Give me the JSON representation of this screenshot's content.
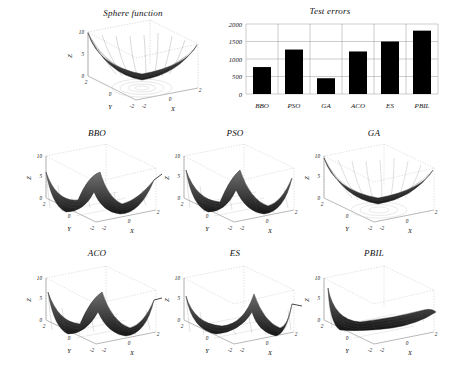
{
  "figure": {
    "panels": [
      {
        "id": "sphere",
        "title": "Sphere function",
        "kind": "surface-3d",
        "shape": "bowl"
      },
      {
        "id": "bbo",
        "title": "BBO",
        "kind": "surface-3d",
        "shape": "saddle-wave"
      },
      {
        "id": "pso",
        "title": "PSO",
        "kind": "surface-3d",
        "shape": "trough"
      },
      {
        "id": "ga",
        "title": "GA",
        "kind": "surface-3d",
        "shape": "bowl"
      },
      {
        "id": "aco",
        "title": "ACO",
        "kind": "surface-3d",
        "shape": "trough"
      },
      {
        "id": "es",
        "title": "ES",
        "kind": "surface-3d",
        "shape": "trough-flat"
      },
      {
        "id": "pbil",
        "title": "PBIL",
        "kind": "surface-3d",
        "shape": "ramp"
      }
    ],
    "axes3d": {
      "zlabel": "Z",
      "xlabel": "X",
      "ylabel": "Y",
      "zticks": [
        "0",
        "5",
        "10"
      ],
      "xticks": [
        "-2",
        "0",
        "2"
      ],
      "yticks": [
        "2",
        "0",
        "-2"
      ],
      "zlim": [
        0,
        10
      ],
      "xlim": [
        -2,
        2
      ],
      "ylim": [
        -2,
        2
      ]
    }
  },
  "chart_data": {
    "type": "bar",
    "title": "Test errors",
    "categories": [
      "BBO",
      "PSO",
      "GA",
      "ACO",
      "ES",
      "PBIL"
    ],
    "values": [
      770,
      1270,
      450,
      1215,
      1500,
      1810
    ],
    "xlabel": "",
    "ylabel": "",
    "ylim": [
      0,
      2000
    ],
    "yticks": [
      0,
      500,
      1000,
      1500,
      2000
    ],
    "yticklabels": [
      "0",
      "500",
      "1000",
      "1500",
      "2000"
    ],
    "grid": true,
    "legend": "none",
    "bar_color": "#000000"
  }
}
